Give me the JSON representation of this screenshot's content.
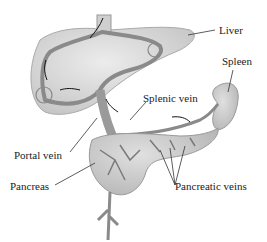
{
  "labels": {
    "liver": "Liver",
    "spleen": "Spleen",
    "splenic_vein": "Splenic vein",
    "portal_vein": "Portal vein",
    "pancreas": "Pancreas",
    "pancreatic_veins": "Pancreatic veins"
  },
  "colors": {
    "organ_fill": "#d9d9d9",
    "organ_stroke": "#9a9a9a",
    "vein": "#8a8a8a",
    "text": "#222222"
  }
}
